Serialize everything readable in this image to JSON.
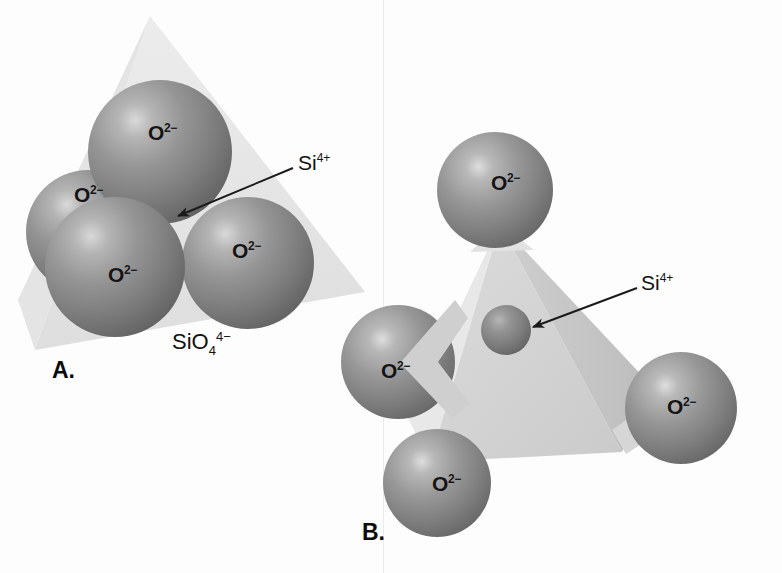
{
  "figure": {
    "background_color": "#fdfdfd",
    "width": 782,
    "height": 573
  },
  "colors": {
    "oxygen_sphere_mid": "#8e8e8e",
    "oxygen_sphere_dark": "#5e5e5e",
    "oxygen_highlight": "#d8d8d8",
    "silicon_sphere_mid": "#8a8a8a",
    "tetrahedron_light": "#e0e0e0",
    "tetrahedron_mid": "#d2d2d2",
    "tetrahedron_dark": "#c2c2c2",
    "label_color": "#121212",
    "arrow_color": "#1a1a1a"
  },
  "panels": [
    {
      "id": "A",
      "letter": "A.",
      "formula": {
        "element": "SiO",
        "subscript": "4",
        "superscript": "4−"
      },
      "callout": {
        "base": "Si",
        "superscript": "4+"
      },
      "atoms": [
        {
          "id": "a-top",
          "label": "O",
          "charge": "2−"
        },
        {
          "id": "a-left-back",
          "label": "O",
          "charge": "2−"
        },
        {
          "id": "a-front-left",
          "label": "O",
          "charge": "2−"
        },
        {
          "id": "a-right",
          "label": "O",
          "charge": "2−"
        }
      ]
    },
    {
      "id": "B",
      "letter": "B.",
      "callout": {
        "base": "Si",
        "superscript": "4+"
      },
      "atoms": [
        {
          "id": "b-top",
          "label": "O",
          "charge": "2−"
        },
        {
          "id": "b-left",
          "label": "O",
          "charge": "2−"
        },
        {
          "id": "b-bottom",
          "label": "O",
          "charge": "2−"
        },
        {
          "id": "b-right",
          "label": "O",
          "charge": "2−"
        }
      ],
      "center_atom": {
        "label": "Si",
        "charge": "4+"
      }
    }
  ]
}
